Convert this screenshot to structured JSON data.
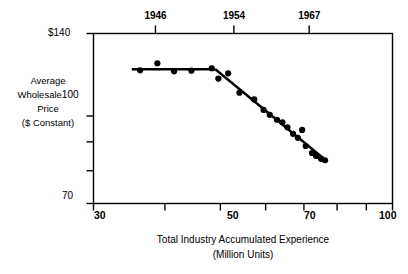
{
  "chart_data": {
    "type": "scatter",
    "title": "",
    "subtitle": "",
    "xlabel": "Total Industry Accumulated Experience",
    "xlabel_sub": "(Million Units)",
    "ylabel_lines": [
      "Average",
      "Wholesale",
      "Price",
      "($ Constant)"
    ],
    "ylabel": "Average Wholesale Price ($ Constant)",
    "scale": "log-log",
    "grid": false,
    "legend": null,
    "xlim": [
      30,
      100
    ],
    "ylim": [
      70,
      140
    ],
    "x_ticks_labeled": [
      {
        "value": 30,
        "label": "30"
      },
      {
        "value": 50,
        "label": "50"
      },
      {
        "value": 70,
        "label": "70"
      },
      {
        "value": 100,
        "label": "100"
      }
    ],
    "x_ticks_unlabeled": [
      40,
      60,
      80,
      90
    ],
    "y_ticks_labeled": [
      {
        "value": 140,
        "label": "$140"
      },
      {
        "value": 100,
        "label": "100"
      },
      {
        "value": 70,
        "label": "70"
      }
    ],
    "y_ticks_unlabeled": [
      90,
      80
    ],
    "top_axis_label": "Year",
    "top_axis_ticks": [
      {
        "label": "1946",
        "x_value": 38.5
      },
      {
        "label": "1954",
        "x_value": 52.8
      },
      {
        "label": "1967",
        "x_value": 71.5
      }
    ],
    "points": [
      {
        "x": 36.2,
        "y": 120.5
      },
      {
        "x": 38.8,
        "y": 124.0
      },
      {
        "x": 41.5,
        "y": 120.0
      },
      {
        "x": 44.5,
        "y": 120.3
      },
      {
        "x": 48.3,
        "y": 121.5
      },
      {
        "x": 49.6,
        "y": 116.5
      },
      {
        "x": 51.6,
        "y": 119.0
      },
      {
        "x": 54.0,
        "y": 110.0
      },
      {
        "x": 57.3,
        "y": 107.0
      },
      {
        "x": 59.5,
        "y": 102.5
      },
      {
        "x": 61.0,
        "y": 100.5
      },
      {
        "x": 62.8,
        "y": 98.5
      },
      {
        "x": 64.2,
        "y": 97.5
      },
      {
        "x": 65.5,
        "y": 95.5
      },
      {
        "x": 67.0,
        "y": 93.0
      },
      {
        "x": 68.3,
        "y": 91.5
      },
      {
        "x": 69.5,
        "y": 94.5
      },
      {
        "x": 70.5,
        "y": 88.5
      },
      {
        "x": 72.3,
        "y": 86.0
      },
      {
        "x": 73.5,
        "y": 85.0
      },
      {
        "x": 75.0,
        "y": 84.0
      },
      {
        "x": 76.2,
        "y": 83.5
      }
    ],
    "fit_segments": [
      {
        "name": "flat-segment",
        "from": {
          "x": 35.0,
          "y": 121.0
        },
        "to": {
          "x": 49.0,
          "y": 121.0
        }
      },
      {
        "name": "declining-segment",
        "from": {
          "x": 49.0,
          "y": 121.0
        },
        "to": {
          "x": 77.0,
          "y": 83.0
        }
      }
    ],
    "marker_color": "#000000",
    "line_color": "#000000",
    "frame_color": "#000000",
    "background_color": "#ffffff"
  }
}
